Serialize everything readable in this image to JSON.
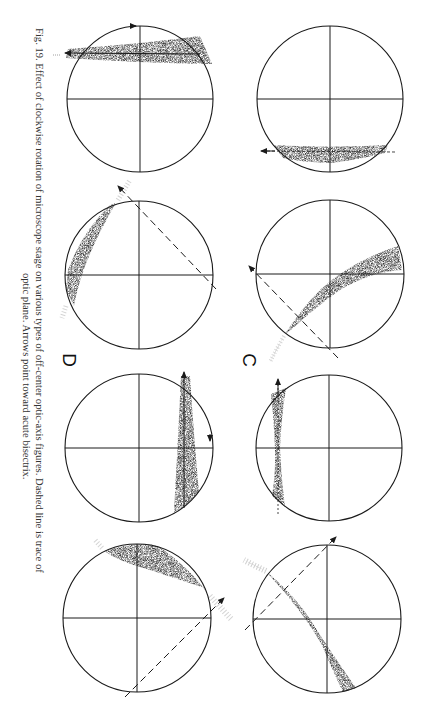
{
  "figure": {
    "number_label": "Fig. 19.",
    "caption_line1": "Fig. 19.  Effect of clockwise rotation of microscope stage on various types of off-center optic-axis figures.  Dashed line is trace of",
    "caption_line2": "optic plane.  Arrows point toward acute bisectrix.",
    "orientation": "rotated 90 degrees clockwise",
    "panel_labels": {
      "c": "C",
      "d": "D"
    },
    "ink_color": "#1a1a1a",
    "shade_color": "#3a3a3a",
    "circles": [
      {
        "id": "row1-left",
        "cx": 140,
        "cy": 99,
        "r": 73,
        "type": "band with arrow"
      },
      {
        "id": "row1-right",
        "cx": 330,
        "cy": 99,
        "r": 73,
        "type": "band with arrow"
      },
      {
        "id": "row2-left",
        "cx": 139,
        "cy": 275,
        "r": 74,
        "type": "curved isogyre with dashed optic plane"
      },
      {
        "id": "row2-right",
        "cx": 330,
        "cy": 274,
        "r": 74,
        "type": "curved isogyre with dashed optic plane"
      },
      {
        "id": "row3-left",
        "cx": 139,
        "cy": 448,
        "r": 74,
        "type": "band with arrow"
      },
      {
        "id": "row3-right",
        "cx": 329,
        "cy": 448,
        "r": 73,
        "type": "hourglass band with arrow"
      },
      {
        "id": "row4-left",
        "cx": 137,
        "cy": 618,
        "r": 74,
        "type": "curved isogyre with dashed optic plane"
      },
      {
        "id": "row4-right",
        "cx": 327,
        "cy": 619,
        "r": 74,
        "type": "curved isogyre with dashed optic plane"
      }
    ]
  }
}
